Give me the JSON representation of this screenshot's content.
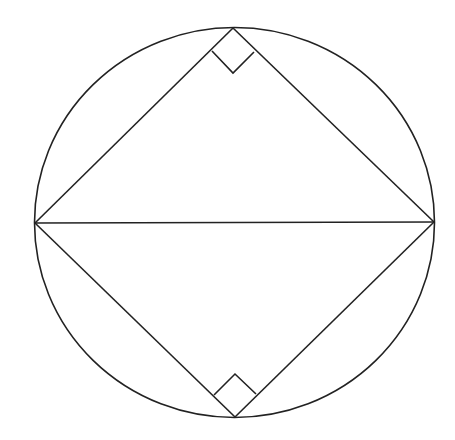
{
  "diagram": {
    "title": "",
    "stroke_color": "#222222",
    "background": "#ffffff",
    "circle": {
      "cx": 234.5,
      "cy": 222.5,
      "rx": 200,
      "ry": 195
    },
    "vertices": {
      "top": [
        233,
        28
      ],
      "bottom": [
        235,
        417
      ],
      "left": [
        35,
        223
      ],
      "right": [
        434,
        222
      ]
    },
    "segments": [
      {
        "name": "diameter",
        "from": "left",
        "to": "right"
      },
      {
        "name": "left-top",
        "from": "left",
        "to": "top"
      },
      {
        "name": "top-right",
        "from": "top",
        "to": "right"
      },
      {
        "name": "left-bottom",
        "from": "left",
        "to": "bottom"
      },
      {
        "name": "bottom-right",
        "from": "bottom",
        "to": "right"
      }
    ],
    "right_angle_markers": [
      {
        "name": "top-right-angle",
        "points": [
          [
            212,
            51
          ],
          [
            233,
            73
          ],
          [
            254,
            52
          ]
        ]
      },
      {
        "name": "bottom-right-angle",
        "points": [
          [
            214,
            395
          ],
          [
            235,
            374
          ],
          [
            256,
            394
          ]
        ]
      }
    ]
  }
}
